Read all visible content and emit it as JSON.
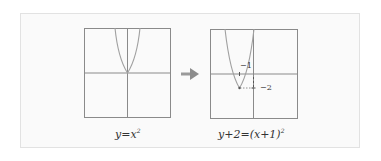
{
  "diagram": {
    "left_graph": {
      "equation": "y=x²",
      "equation_base": "y=x",
      "equation_exp": "2",
      "vertex": [
        0,
        0
      ]
    },
    "arrow": "right-arrow",
    "right_graph": {
      "equation": "y+2=(x+1)²",
      "equation_base": "y+2=(x+1)",
      "equation_exp": "2",
      "vertex": [
        -1,
        -2
      ],
      "labels": {
        "x_tick": "−1",
        "y_tick": "−2"
      }
    },
    "colors": {
      "axis": "#888888",
      "curve": "#9a9a9a",
      "arrow": "#9a9a9a",
      "frame": "#e2e2e2"
    }
  }
}
